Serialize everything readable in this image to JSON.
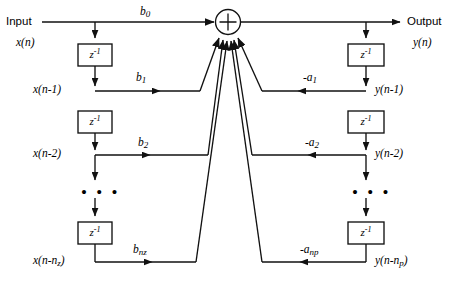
{
  "diagram": {
    "stroke_color": "#111111",
    "background_color": "#ffffff",
    "input": {
      "label": "Input",
      "signal": "x(n)"
    },
    "output": {
      "label": "Output",
      "signal": "y(n)"
    },
    "summing_junction": {
      "symbol": "+",
      "name": "adder"
    },
    "delay_block": {
      "base": "z",
      "exponent": "-1",
      "display": "z-1"
    },
    "ellipsis": "• • •",
    "feedforward": {
      "branch_name": "feedforward",
      "taps": [
        {
          "signal_base": "x(n)",
          "signal_sub": "",
          "coef_base": "b",
          "coef_sub": "0"
        },
        {
          "signal_base": "x(n-1)",
          "signal_sub": "",
          "coef_base": "b",
          "coef_sub": "1"
        },
        {
          "signal_base": "x(n-2)",
          "signal_sub": "",
          "coef_base": "b",
          "coef_sub": "2"
        },
        {
          "signal_base": "x(n-n",
          "signal_sub": "z",
          "coef_base": "b",
          "coef_sub": "nz"
        }
      ]
    },
    "feedback": {
      "branch_name": "feedback",
      "taps": [
        {
          "signal_base": "y(n)",
          "signal_sub": "",
          "coef_base": "",
          "coef_sub": ""
        },
        {
          "signal_base": "y(n-1)",
          "signal_sub": "",
          "coef_base": "-a",
          "coef_sub": "1"
        },
        {
          "signal_base": "y(n-2)",
          "signal_sub": "",
          "coef_base": "-a",
          "coef_sub": "2"
        },
        {
          "signal_base": "y(n-n",
          "signal_sub": "p",
          "coef_base": "-a",
          "coef_sub": "np"
        }
      ]
    },
    "labels": {
      "b0": "b",
      "b0_sub": "0",
      "b1": "b",
      "b1_sub": "1",
      "b2": "b",
      "b2_sub": "2",
      "bnz": "b",
      "bnz_sub": "nz",
      "a1": "-a",
      "a1_sub": "1",
      "a2": "-a",
      "a2_sub": "2",
      "anp": "-a",
      "anp_sub": "np",
      "xn": "x(n)",
      "xn1": "x(n-1)",
      "xn2": "x(n-2)",
      "xnnz_base": "x(n-n",
      "xnnz_sub": "z",
      "xnnz_close": ")",
      "yn": "y(n)",
      "yn1": "y(n-1)",
      "yn2": "y(n-2)",
      "ynnp_base": "y(n-n",
      "ynnp_sub": "p",
      "ynnp_close": ")",
      "z_base": "z",
      "z_exp": "-1"
    }
  }
}
